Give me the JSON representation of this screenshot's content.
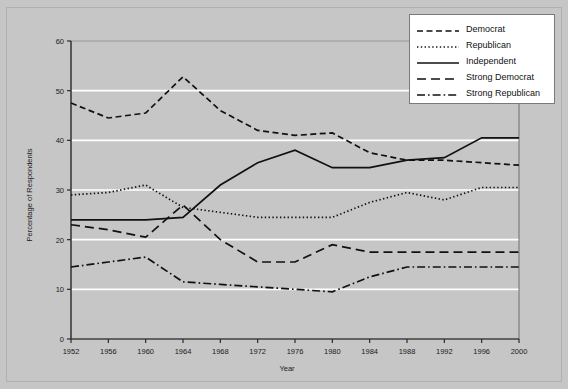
{
  "chart_data": {
    "type": "line",
    "title": "",
    "xlabel": "Year",
    "ylabel": "Percentage of Respondents",
    "x": [
      1952,
      1956,
      1960,
      1964,
      1968,
      1972,
      1976,
      1980,
      1984,
      1988,
      1992,
      1996,
      2000
    ],
    "xtick_labels": [
      "1952",
      "1956",
      "1960",
      "1964",
      "1968",
      "1972",
      "1976",
      "1980",
      "1984",
      "1988",
      "1992",
      "1996",
      "2000"
    ],
    "ytick_labels": [
      "0",
      "10",
      "20",
      "30",
      "40",
      "50",
      "60"
    ],
    "yticks": [
      0,
      10,
      20,
      30,
      40,
      50,
      60
    ],
    "ylim": [
      0,
      60
    ],
    "xlim": [
      1952,
      2000
    ],
    "grid": "horizontal-white",
    "legend_position": "top-right",
    "plot_bgcolor": "#c6c6c6",
    "gridline_color": "#ffffff",
    "line_color": "#111111",
    "series": [
      {
        "name": "Democrat",
        "style": "dashed",
        "values": [
          47.5,
          44.5,
          45.5,
          52.8,
          46.0,
          42.0,
          41.0,
          41.5,
          37.5,
          36.0,
          36.0,
          35.5,
          35.0
        ]
      },
      {
        "name": "Republican",
        "style": "dotted",
        "values": [
          29.0,
          29.5,
          31.0,
          26.5,
          25.5,
          24.5,
          24.5,
          24.5,
          27.5,
          29.5,
          28.0,
          30.5,
          30.5
        ]
      },
      {
        "name": "Independent",
        "style": "solid",
        "values": [
          24.0,
          24.0,
          24.0,
          24.5,
          31.0,
          35.5,
          38.0,
          34.5,
          34.5,
          36.0,
          36.5,
          40.5,
          40.5
        ]
      },
      {
        "name": "Strong Democrat",
        "style": "long-dashed",
        "values": [
          23.0,
          22.0,
          20.5,
          27.0,
          20.0,
          15.5,
          15.5,
          19.0,
          17.5,
          17.5,
          17.5,
          17.5,
          17.5
        ]
      },
      {
        "name": "Strong Republican",
        "style": "dash-dot",
        "values": [
          14.5,
          15.5,
          16.5,
          11.5,
          11.0,
          10.5,
          10.0,
          9.5,
          12.5,
          14.5,
          14.5,
          14.5,
          14.5
        ]
      }
    ]
  },
  "legend": {
    "items": [
      {
        "label": "Democrat",
        "style": "dashed"
      },
      {
        "label": "Republican",
        "style": "dotted"
      },
      {
        "label": "Independent",
        "style": "solid"
      },
      {
        "label": "Strong Democrat",
        "style": "long-dashed"
      },
      {
        "label": "Strong Republican",
        "style": "dash-dot"
      }
    ]
  }
}
